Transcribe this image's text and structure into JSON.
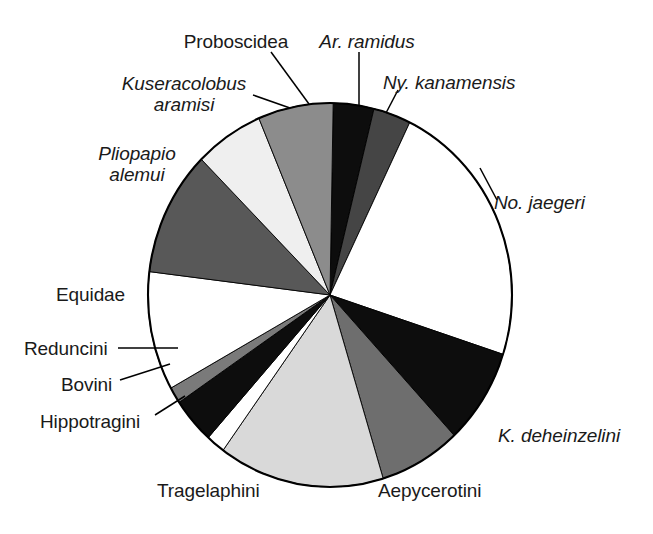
{
  "figure": {
    "background_color": "#ffffff",
    "outline_color": "#000000",
    "text_color": "#1a1a1a"
  },
  "chart_data": {
    "type": "pie",
    "title": "",
    "subtitle": "",
    "xlabel": "",
    "ylabel": "",
    "legend_position": "none",
    "grid": false,
    "labels_outside": true,
    "start_angle_deg": 0,
    "direction": "clockwise",
    "center": {
      "cx": 330,
      "cy": 295,
      "rx": 182,
      "ry": 192
    },
    "categories": [
      "Ar. ramidus",
      "Ny. kanamensis",
      "No. jaegeri",
      "K. deheinzelini",
      "Aepycerotini",
      "Tragelaphini",
      "Hippotragini",
      "Bovini",
      "Reduncini",
      "Equidae",
      "Pliopapio alemui",
      "Kuseracolobus aramisi",
      "Proboscidea"
    ],
    "values": [
      3.6,
      3.3,
      22.8,
      8.1,
      7.2,
      14.7,
      1.7,
      3.9,
      1.4,
      10.0,
      10.6,
      6.1,
      6.6
    ],
    "units": "percent of specimens",
    "slices": [
      {
        "label": "Ar. ramidus",
        "italic": true,
        "start_deg": 1,
        "end_deg": 14,
        "percent": 3.6,
        "fill": "#0d0d0d"
      },
      {
        "label": "Ny. kanamensis",
        "italic": true,
        "start_deg": 14,
        "end_deg": 26,
        "percent": 3.3,
        "fill": "#454545"
      },
      {
        "label": "No. jaegeri",
        "italic": true,
        "start_deg": 26,
        "end_deg": 108,
        "percent": 22.8,
        "fill": "#ffffff"
      },
      {
        "label": "K. deheinzelini",
        "italic": true,
        "start_deg": 108,
        "end_deg": 137,
        "percent": 8.1,
        "fill": "#0d0d0d"
      },
      {
        "label": "Aepycerotini",
        "italic": false,
        "start_deg": 137,
        "end_deg": 163,
        "percent": 7.2,
        "fill": "#6e6e6e"
      },
      {
        "label": "Tragelaphini",
        "italic": false,
        "start_deg": 163,
        "end_deg": 216,
        "percent": 14.7,
        "fill": "#d9d9d9"
      },
      {
        "label": "Hippotragini",
        "italic": false,
        "start_deg": 216,
        "end_deg": 222,
        "percent": 1.7,
        "fill": "#ffffff"
      },
      {
        "label": "Bovini",
        "italic": false,
        "start_deg": 222,
        "end_deg": 236,
        "percent": 3.9,
        "fill": "#0d0d0d"
      },
      {
        "label": "Reduncini",
        "italic": false,
        "start_deg": 236,
        "end_deg": 241,
        "percent": 1.4,
        "fill": "#7a7a7a"
      },
      {
        "label": "Equidae",
        "italic": false,
        "start_deg": 241,
        "end_deg": 277,
        "percent": 10.0,
        "fill": "#ffffff"
      },
      {
        "label": "Pliopapio alemui",
        "italic": true,
        "start_deg": 277,
        "end_deg": 315,
        "percent": 10.6,
        "fill": "#585858"
      },
      {
        "label": "Kuseracolobus aramisi",
        "italic": true,
        "start_deg": 315,
        "end_deg": 337,
        "percent": 6.1,
        "fill": "#efefef"
      },
      {
        "label": "Proboscidea",
        "italic": false,
        "start_deg": 337,
        "end_deg": 361,
        "percent": 6.6,
        "fill": "#8c8c8c"
      }
    ]
  },
  "labels": [
    {
      "id": "proboscidea",
      "text": "Proboscidea",
      "line1": "Proboscidea",
      "line2": "",
      "italic": false,
      "x": 169,
      "y": 31,
      "w": 134,
      "align": "align-center"
    },
    {
      "id": "ar-ramidus",
      "text": "Ar. ramidus",
      "line1": "Ar. ramidus",
      "line2": "",
      "italic": true,
      "x": 310,
      "y": 31,
      "w": 114,
      "align": "align-center"
    },
    {
      "id": "ny-kanamensis",
      "text": "Ny. kanamensis",
      "line1": "Ny. kanamensis",
      "line2": "",
      "italic": true,
      "x": 383,
      "y": 72,
      "w": 152,
      "align": "align-left"
    },
    {
      "id": "kuseracolobus",
      "text": "Kuseracolobus aramisi",
      "line1": "Kuseracolobus",
      "line2": "aramisi",
      "italic": true,
      "x": 104,
      "y": 73,
      "w": 160,
      "align": "align-center"
    },
    {
      "id": "pliopapio",
      "text": "Pliopapio alemui",
      "line1": "Pliopapio",
      "line2": "alemui",
      "italic": true,
      "x": 72,
      "y": 143,
      "w": 130,
      "align": "align-center"
    },
    {
      "id": "no-jaegeri",
      "text": "No. jaegeri",
      "line1": "No. jaegeri",
      "line2": "",
      "italic": true,
      "x": 494,
      "y": 192,
      "w": 120,
      "align": "align-left"
    },
    {
      "id": "equidae",
      "text": "Equidae",
      "line1": "Equidae",
      "line2": "",
      "italic": false,
      "x": 56,
      "y": 284,
      "w": 82,
      "align": "align-left"
    },
    {
      "id": "reduncini",
      "text": "Reduncini",
      "line1": "Reduncini",
      "line2": "",
      "italic": false,
      "x": 24,
      "y": 338,
      "w": 93,
      "align": "align-left"
    },
    {
      "id": "bovini",
      "text": "Bovini",
      "line1": "Bovini",
      "line2": "",
      "italic": false,
      "x": 61,
      "y": 374,
      "w": 58,
      "align": "align-left"
    },
    {
      "id": "hippotragini",
      "text": "Hippotragini",
      "line1": "Hippotragini",
      "line2": "",
      "italic": false,
      "x": 40,
      "y": 411,
      "w": 113,
      "align": "align-left"
    },
    {
      "id": "tragelaphini",
      "text": "Tragelaphini",
      "line1": "Tragelaphini",
      "line2": "",
      "italic": false,
      "x": 157,
      "y": 480,
      "w": 113,
      "align": "align-left"
    },
    {
      "id": "aepycerotini",
      "text": "Aepycerotini",
      "line1": "Aepycerotini",
      "line2": "",
      "italic": false,
      "x": 378,
      "y": 480,
      "w": 118,
      "align": "align-left"
    },
    {
      "id": "k-deheinzelini",
      "text": "K. deheinzelini",
      "line1": "K. deheinzelini",
      "line2": "",
      "italic": true,
      "x": 498,
      "y": 425,
      "w": 146,
      "align": "align-left"
    }
  ],
  "leader_lines": [
    {
      "id": "proboscidea-leader",
      "x1": 271,
      "y1": 52,
      "x2": 309,
      "y2": 104
    },
    {
      "id": "ar-ramidus-leader",
      "x1": 359,
      "y1": 52,
      "x2": 359,
      "y2": 105
    },
    {
      "id": "ny-kanamensis-leader",
      "x1": 398,
      "y1": 90,
      "x2": 386,
      "y2": 113
    },
    {
      "id": "kuseracolobus-leader",
      "x1": 253,
      "y1": 95,
      "x2": 290,
      "y2": 108
    },
    {
      "id": "reduncini-leader",
      "x1": 118,
      "y1": 348,
      "x2": 178,
      "y2": 348
    },
    {
      "id": "bovini-leader",
      "x1": 120,
      "y1": 380,
      "x2": 170,
      "y2": 364
    },
    {
      "id": "hippotragini-leader",
      "x1": 155,
      "y1": 415,
      "x2": 185,
      "y2": 396
    },
    {
      "id": "no-jaegeri-leader",
      "x1": 480,
      "y1": 168,
      "x2": 497,
      "y2": 200
    }
  ]
}
